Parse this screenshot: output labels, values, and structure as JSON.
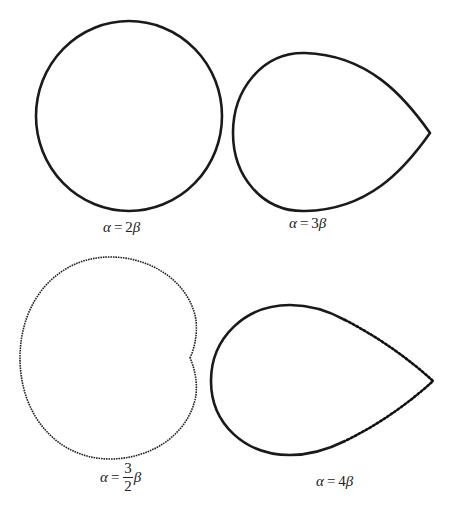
{
  "figure": {
    "background": "#ffffff",
    "stroke_color": "#1a1a1a",
    "panels": [
      {
        "id": "alpha-2beta",
        "shape": "circle",
        "label": {
          "lhs": "α",
          "eq": "=",
          "coef": "2",
          "rhs": "β"
        },
        "center": [
          129,
          116
        ],
        "radius": [
          93,
          95
        ],
        "label_pos": [
          103,
          219
        ]
      },
      {
        "id": "alpha-3beta",
        "shape": "teardrop",
        "label": {
          "lhs": "α",
          "eq": "=",
          "coef": "3",
          "rhs": "β"
        },
        "bbox": {
          "left": 233,
          "top": 53,
          "bottom": 211,
          "tip_x": 430,
          "tip_y": 133
        },
        "label_pos": [
          289,
          215
        ]
      },
      {
        "id": "alpha-3-2-beta",
        "shape": "cardioid-like",
        "label": {
          "lhs": "α",
          "eq": "=",
          "num": "3",
          "den": "2",
          "rhs": "β"
        },
        "bbox": {
          "left": 20,
          "top": 257,
          "right": 197,
          "bottom": 459,
          "cusp_x": 190,
          "cusp_y": 358
        },
        "label_pos": [
          100,
          461
        ]
      },
      {
        "id": "alpha-4beta",
        "shape": "teardrop",
        "label": {
          "lhs": "α",
          "eq": "=",
          "coef": "4",
          "rhs": "β"
        },
        "bbox": {
          "left": 211,
          "top": 305,
          "bottom": 455,
          "tip_x": 433,
          "tip_y": 381
        },
        "label_pos": [
          316,
          473
        ]
      }
    ]
  }
}
